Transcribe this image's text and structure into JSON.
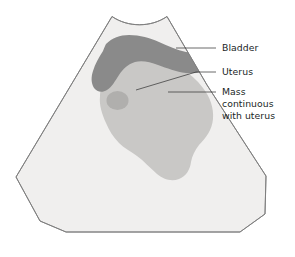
{
  "figure": {
    "name": "pelvic-ultrasound-schematic",
    "modality_shape": "ultrasound-sector-fan",
    "background_color": "#ffffff",
    "outline_color": "#7d7d7d",
    "fan_fill": "#f0efee",
    "regions": [
      {
        "id": "bladder",
        "label": "Bladder",
        "fill": "#8a8a8a"
      },
      {
        "id": "uterus",
        "label": "Uterus",
        "fill": "#c9c8c6"
      },
      {
        "id": "mass",
        "label": "Mass continuous with uterus",
        "fill": "#b0afad"
      }
    ]
  },
  "labels": [
    {
      "id": "bladder-label",
      "lines": [
        "Bladder"
      ],
      "text": "Bladder",
      "color": "#211f1f"
    },
    {
      "id": "uterus-label",
      "lines": [
        "Uterus"
      ],
      "text": "Uterus",
      "color": "#211f1f"
    },
    {
      "id": "mass-label",
      "lines": [
        "Mass",
        "continuous",
        "with uterus"
      ],
      "line1": "Mass",
      "line2": "continuous",
      "line3": "with uterus",
      "color": "#211f1f"
    }
  ]
}
